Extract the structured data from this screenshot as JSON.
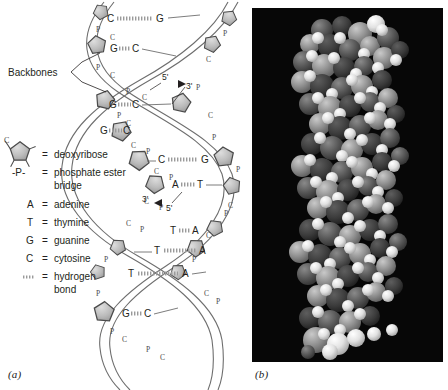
{
  "figure": {
    "panels": [
      {
        "id": "a",
        "caption": "(a)",
        "type": "schematic-double-helix"
      },
      {
        "id": "b",
        "caption": "(b)",
        "type": "space-filling-model-photograph"
      }
    ]
  },
  "panel_a": {
    "annotations": {
      "backbones_label": "Backbones",
      "polarity_markers": [
        {
          "five_prime": "5'",
          "three_prime": "3'",
          "position": "upper-right-strand"
        },
        {
          "five_prime": "5'",
          "three_prime": "3'",
          "position": "lower-left-strand"
        }
      ],
      "phosphate_symbol": "P",
      "sugar_symbol": "C"
    },
    "base_pairs": [
      {
        "left": "C",
        "right": "G",
        "bond_width": "wide"
      },
      {
        "left": "G",
        "right": "C",
        "bond_width": "narrow"
      },
      {
        "left": "G",
        "right": "C",
        "bond_width": "narrow"
      },
      {
        "left": "G",
        "right": "C",
        "bond_width": "narrow"
      },
      {
        "left": "C",
        "right": "G",
        "bond_width": "wide"
      },
      {
        "left": "A",
        "right": "T",
        "bond_width": "narrow"
      },
      {
        "left": "T",
        "right": "A",
        "bond_width": "narrow"
      },
      {
        "left": "T",
        "right": "A",
        "bond_width": "wide"
      },
      {
        "left": "T",
        "right": "A",
        "bond_width": "wide"
      },
      {
        "left": "G",
        "right": "C",
        "bond_width": "narrow"
      }
    ],
    "legend": {
      "items": [
        {
          "symbol": "pentagon",
          "symbol_label": "C",
          "equals": "=",
          "text": "deoxyribose",
          "text2": ""
        },
        {
          "symbol": "-P-",
          "symbol_label": "-P-",
          "equals": "=",
          "text": "phosphate ester",
          "text2": "bridge"
        },
        {
          "symbol": "A",
          "symbol_label": "A",
          "equals": "=",
          "text": "adenine",
          "text2": ""
        },
        {
          "symbol": "T",
          "symbol_label": "T",
          "equals": "=",
          "text": "thymine",
          "text2": ""
        },
        {
          "symbol": "G",
          "symbol_label": "G",
          "equals": "=",
          "text": "guanine",
          "text2": ""
        },
        {
          "symbol": "C",
          "symbol_label": "C",
          "equals": "=",
          "text": "cytosine",
          "text2": ""
        },
        {
          "symbol": "dotted",
          "symbol_label": "···",
          "equals": "=",
          "text": "hydrogen",
          "text2": "bond"
        }
      ]
    }
  },
  "colors": {
    "background": "#ffffff",
    "ink": "#231f20",
    "sugar_fill": "#b9b9b9",
    "sugar_stroke": "#4a4a4a",
    "helix_line": "#6e6e6e",
    "photo_background": "#070707",
    "sphere_light": "#f2f2f2",
    "sphere_mid": "#9a9a9a",
    "sphere_dark": "#4d4d4d"
  }
}
